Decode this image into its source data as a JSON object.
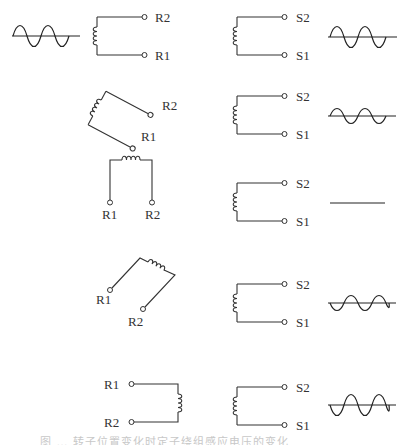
{
  "figure": {
    "source_wave": {
      "label": "excitation-sine",
      "cycles": 2.5
    },
    "rows": [
      {
        "rotor_angle_deg": 0,
        "rotor_labels": {
          "top": "R2",
          "bottom": "R1"
        },
        "stator_labels": {
          "top": "S2",
          "bottom": "S1"
        },
        "output": "in-phase, max amplitude"
      },
      {
        "rotor_angle_deg": 30,
        "rotor_labels": {
          "top": "R2",
          "bottom": "R1"
        },
        "stator_labels": {
          "top": "S2",
          "bottom": "S1"
        },
        "output": "in-phase, reduced amplitude"
      },
      {
        "rotor_angle_deg": 90,
        "rotor_labels": {
          "left": "R1",
          "right": "R2"
        },
        "stator_labels": {
          "top": "S2",
          "bottom": "S1"
        },
        "output": "zero (flat line)"
      },
      {
        "rotor_angle_deg": 150,
        "rotor_labels": {
          "left": "R1",
          "right": "R2"
        },
        "stator_labels": {
          "top": "S2",
          "bottom": "S1"
        },
        "output": "inverted, reduced amplitude"
      },
      {
        "rotor_angle_deg": 180,
        "rotor_labels": {
          "top": "R1",
          "bottom": "R2"
        },
        "stator_labels": {
          "top": "S2",
          "bottom": "S1"
        },
        "output": "inverted, max amplitude"
      }
    ],
    "labels": {
      "r1": "R1",
      "r2": "R2",
      "s1": "S1",
      "s2": "S2"
    },
    "caption": "图 … 转子位置变化时定子绕组感应电压的变化"
  }
}
